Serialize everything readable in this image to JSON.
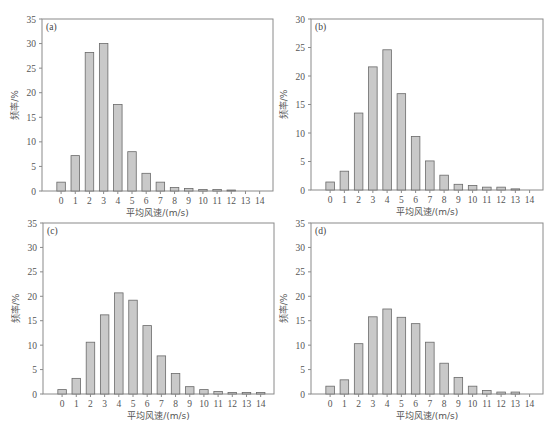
{
  "chart_data": [
    {
      "type": "bar",
      "panel": "(a)",
      "title": "",
      "xlabel": "平均风速/(m/s)",
      "ylabel": "频率/%",
      "categories": [
        "0",
        "1",
        "2",
        "3",
        "4",
        "5",
        "6",
        "7",
        "8",
        "9",
        "10",
        "11",
        "12",
        "13",
        "14"
      ],
      "values": [
        1.8,
        7.2,
        28.2,
        30.0,
        17.6,
        8.0,
        3.6,
        1.8,
        0.7,
        0.5,
        0.3,
        0.3,
        0.2,
        0,
        0
      ],
      "ylim": [
        0,
        35
      ],
      "yticks": [
        0,
        5,
        10,
        15,
        20,
        25,
        30,
        35
      ],
      "grid": false
    },
    {
      "type": "bar",
      "panel": "(b)",
      "title": "",
      "xlabel": "平均风速/(m/s)",
      "ylabel": "频率/%",
      "categories": [
        "0",
        "1",
        "2",
        "3",
        "4",
        "5",
        "6",
        "7",
        "8",
        "9",
        "10",
        "11",
        "12",
        "13",
        "14"
      ],
      "values": [
        1.4,
        3.3,
        13.5,
        21.6,
        24.6,
        16.9,
        9.4,
        5.1,
        2.6,
        1.0,
        0.8,
        0.5,
        0.5,
        0.2,
        0
      ],
      "ylim": [
        0,
        30
      ],
      "yticks": [
        0,
        5,
        10,
        15,
        20,
        25,
        30
      ],
      "grid": false
    },
    {
      "type": "bar",
      "panel": "(c)",
      "title": "",
      "xlabel": "平均风速/(m/s)",
      "ylabel": "频率/%",
      "categories": [
        "0",
        "1",
        "2",
        "3",
        "4",
        "5",
        "6",
        "7",
        "8",
        "9",
        "10",
        "11",
        "12",
        "13",
        "14"
      ],
      "values": [
        0.9,
        3.2,
        10.6,
        16.2,
        20.7,
        19.2,
        14.0,
        7.8,
        4.2,
        1.5,
        0.9,
        0.5,
        0.3,
        0.3,
        0.3
      ],
      "ylim": [
        0,
        35
      ],
      "yticks": [
        0,
        5,
        10,
        15,
        20,
        25,
        30,
        35
      ],
      "grid": false
    },
    {
      "type": "bar",
      "panel": "(d)",
      "title": "",
      "xlabel": "平均风速/(m/s)",
      "ylabel": "频率/%",
      "categories": [
        "0",
        "1",
        "2",
        "3",
        "4",
        "5",
        "6",
        "7",
        "8",
        "9",
        "10",
        "11",
        "12",
        "13",
        "14"
      ],
      "values": [
        1.6,
        2.9,
        10.3,
        15.8,
        17.4,
        15.7,
        14.4,
        10.6,
        6.3,
        3.4,
        1.6,
        0.7,
        0.4,
        0.4,
        0
      ],
      "ylim": [
        0,
        35
      ],
      "yticks": [
        0,
        5,
        10,
        15,
        20,
        25,
        30,
        35
      ],
      "grid": false
    }
  ],
  "colors": {
    "bar_fill": "#c9c9c9",
    "bar_stroke": "#6a6a6a",
    "axis": "#8a8a8a"
  }
}
